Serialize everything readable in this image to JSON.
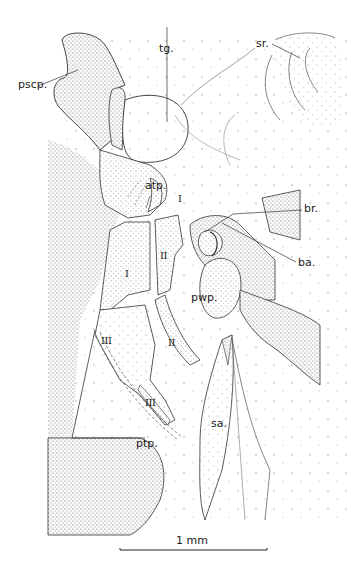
{
  "figure": {
    "type": "anatomical line drawing",
    "labels": {
      "pscp": "pscp.",
      "tg": "tg.",
      "sr": "sr.",
      "atp": "atp.",
      "br": "br.",
      "ba": "ba.",
      "pwp": "pwp.",
      "sa": "sa.",
      "ptp": "ptp."
    },
    "roman_labels": {
      "i_upper": "I",
      "i_lower": "I",
      "ii_upper": "II",
      "ii_lower": "II",
      "iii_left": "III",
      "iii_lower": "III"
    },
    "scale_bar": {
      "label": "1 mm"
    }
  }
}
